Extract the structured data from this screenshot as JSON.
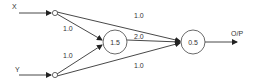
{
  "diagram": {
    "type": "neural-network-perceptron",
    "inputs": [
      {
        "id": "x",
        "label": "X"
      },
      {
        "id": "y",
        "label": "Y"
      }
    ],
    "hidden_node": {
      "id": "h",
      "threshold": "1.5"
    },
    "output_node": {
      "id": "o",
      "threshold": "0.5"
    },
    "output_label": "O/P",
    "edges": [
      {
        "from": "x",
        "to": "h",
        "weight": "1.0"
      },
      {
        "from": "y",
        "to": "h",
        "weight": "1.0"
      },
      {
        "from": "x",
        "to": "o",
        "weight": "1.0"
      },
      {
        "from": "h",
        "to": "o",
        "weight": "2.0"
      },
      {
        "from": "y",
        "to": "o",
        "weight": "1.0"
      }
    ],
    "colors": {
      "stroke": "#333333",
      "background": "#ffffff"
    }
  }
}
